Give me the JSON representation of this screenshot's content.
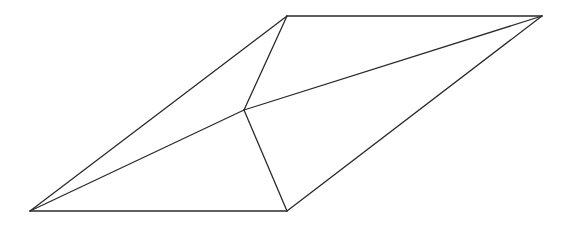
{
  "diagram": {
    "type": "line-drawing",
    "stroke_color": "#2a2a2a",
    "background": "#ffffff",
    "vertices": {
      "A": {
        "x": 30,
        "y": 211
      },
      "B": {
        "x": 287,
        "y": 211
      },
      "C": {
        "x": 287,
        "y": 16
      },
      "D": {
        "x": 542,
        "y": 16
      },
      "E": {
        "x": 244,
        "y": 110
      }
    },
    "edges": [
      {
        "id": "AB",
        "from": "A",
        "to": "B",
        "role": "outer-bottom"
      },
      {
        "id": "CD",
        "from": "C",
        "to": "D",
        "role": "outer-top"
      },
      {
        "id": "AC",
        "from": "A",
        "to": "C",
        "role": "outer-left"
      },
      {
        "id": "BD",
        "from": "B",
        "to": "D",
        "role": "outer-right"
      },
      {
        "id": "AE",
        "from": "A",
        "to": "E",
        "role": "interior"
      },
      {
        "id": "ED",
        "from": "E",
        "to": "D",
        "role": "interior"
      },
      {
        "id": "CE",
        "from": "C",
        "to": "E",
        "role": "interior"
      },
      {
        "id": "EB",
        "from": "E",
        "to": "B",
        "role": "interior"
      }
    ]
  }
}
